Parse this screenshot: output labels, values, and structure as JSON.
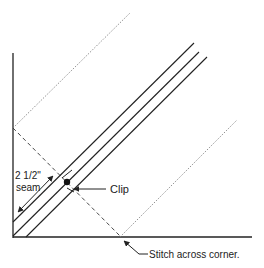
{
  "diagram": {
    "labels": {
      "seam_line1": "2 1/2\"",
      "seam_line2": "seam",
      "clip": "Clip",
      "stitch": "Stitch across corner."
    },
    "colors": {
      "line": "#222222",
      "dotted": "#777777",
      "background": "#ffffff"
    }
  }
}
